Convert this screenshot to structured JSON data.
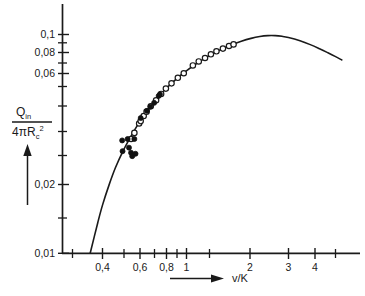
{
  "chart_data": {
    "type": "line",
    "title": "",
    "subtitle": "",
    "xlabel": "v/K",
    "ylabel": "Q_in / (4πR_c²)",
    "xscale": "log",
    "yscale": "log",
    "xlim": [
      0.28,
      5.4
    ],
    "ylim": [
      0.01,
      0.125
    ],
    "grid": false,
    "legend": null,
    "x_tick_labels": [
      "0,4",
      "0,6",
      "0,8",
      "1",
      "2",
      "3",
      "4"
    ],
    "x_tick_values": [
      0.4,
      0.6,
      0.8,
      1,
      2,
      3,
      4
    ],
    "x_minor_ticks": [
      0.3,
      0.5,
      0.7,
      0.9,
      1.5,
      5
    ],
    "y_tick_labels": [
      "0,1",
      "0,08",
      "0,06",
      "0,02",
      "0,01"
    ],
    "y_tick_values": [
      0.1,
      0.08,
      0.06,
      0.02,
      0.01
    ],
    "y_minor_ticks": [
      0.09,
      0.07,
      0.05,
      0.04,
      0.03,
      0.015
    ],
    "curve": {
      "name": "theoretical curve",
      "style": "solid",
      "color": "#1a1a1a",
      "points": [
        [
          0.35,
          0.01
        ],
        [
          0.38,
          0.0138
        ],
        [
          0.4,
          0.0166
        ],
        [
          0.43,
          0.0206
        ],
        [
          0.46,
          0.0246
        ],
        [
          0.5,
          0.0294
        ],
        [
          0.54,
          0.0338
        ],
        [
          0.58,
          0.038
        ],
        [
          0.62,
          0.042
        ],
        [
          0.66,
          0.0457
        ],
        [
          0.7,
          0.0492
        ],
        [
          0.75,
          0.0532
        ],
        [
          0.8,
          0.0568
        ],
        [
          0.85,
          0.0601
        ],
        [
          0.9,
          0.0632
        ],
        [
          0.95,
          0.066
        ],
        [
          1.0,
          0.0686
        ],
        [
          1.1,
          0.0733
        ],
        [
          1.2,
          0.0774
        ],
        [
          1.3,
          0.081
        ],
        [
          1.4,
          0.0841
        ],
        [
          1.5,
          0.0868
        ],
        [
          1.6,
          0.0892
        ],
        [
          1.8,
          0.0931
        ],
        [
          2.0,
          0.096
        ],
        [
          2.2,
          0.0979
        ],
        [
          2.4,
          0.0988
        ],
        [
          2.6,
          0.0988
        ],
        [
          2.8,
          0.0981
        ],
        [
          3.0,
          0.0969
        ],
        [
          3.4,
          0.0936
        ],
        [
          3.8,
          0.0899
        ],
        [
          4.2,
          0.0861
        ],
        [
          4.6,
          0.0825
        ],
        [
          5.0,
          0.0792
        ],
        [
          5.35,
          0.0765
        ]
      ]
    },
    "series": [
      {
        "name": "open circles",
        "marker": "open-circle",
        "color": "#1a1a1a",
        "points": [
          [
            0.545,
            0.0333
          ],
          [
            0.565,
            0.0355
          ],
          [
            0.595,
            0.0392
          ],
          [
            0.605,
            0.0402
          ],
          [
            0.625,
            0.0424
          ],
          [
            0.645,
            0.0444
          ],
          [
            0.675,
            0.047
          ],
          [
            0.715,
            0.05
          ],
          [
            0.755,
            0.0535
          ],
          [
            0.795,
            0.0566
          ],
          [
            0.845,
            0.0598
          ],
          [
            0.905,
            0.0634
          ],
          [
            0.965,
            0.0665
          ],
          [
            1.065,
            0.0722
          ],
          [
            1.135,
            0.0753
          ],
          [
            1.215,
            0.0781
          ],
          [
            1.295,
            0.0812
          ],
          [
            1.375,
            0.0838
          ],
          [
            1.475,
            0.0862
          ],
          [
            1.575,
            0.0886
          ],
          [
            1.655,
            0.0901
          ]
        ]
      },
      {
        "name": "filled circles",
        "marker": "filled-circle",
        "color": "#111111",
        "points": [
          [
            0.495,
            0.0328
          ],
          [
            0.525,
            0.0333
          ],
          [
            0.497,
            0.0293
          ],
          [
            0.533,
            0.0304
          ],
          [
            0.545,
            0.0288
          ],
          [
            0.552,
            0.0278
          ],
          [
            0.565,
            0.0333
          ],
          [
            0.572,
            0.0285
          ],
          [
            0.605,
            0.0415
          ],
          [
            0.648,
            0.0448
          ],
          [
            0.672,
            0.0468
          ],
          [
            0.7,
            0.0487
          ],
          [
            0.735,
            0.0524
          ],
          [
            0.745,
            0.0533
          ]
        ]
      }
    ],
    "ylabel_parts": {
      "numerator_main": "Q",
      "numerator_sub": "in",
      "denominator_main": "4πR",
      "denominator_sub": "c",
      "denominator_sup": "2"
    },
    "annotations": {
      "y_axis_arrow": "up-arrow",
      "x_axis_arrow": "right-arrow"
    }
  }
}
